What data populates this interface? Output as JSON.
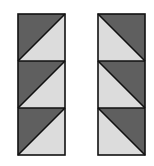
{
  "diagram": {
    "colors": {
      "dark": "#5f5f5f",
      "light": "#dcdcdc",
      "stroke": "#111111",
      "background": "#ffffff"
    },
    "columns": [
      {
        "name": "left-strip",
        "x": 17,
        "y": 13,
        "tile_size": 47,
        "tiles": [
          {
            "dark": "upper-left",
            "diagonal": "bottom-left-to-top-right"
          },
          {
            "dark": "upper-left",
            "diagonal": "bottom-left-to-top-right"
          },
          {
            "dark": "upper-left",
            "diagonal": "bottom-left-to-top-right"
          }
        ]
      },
      {
        "name": "right-strip",
        "x": 97,
        "y": 13,
        "tile_size": 47,
        "tiles": [
          {
            "dark": "upper-right",
            "diagonal": "top-left-to-bottom-right"
          },
          {
            "dark": "upper-right",
            "diagonal": "top-left-to-bottom-right"
          },
          {
            "dark": "upper-right",
            "diagonal": "top-left-to-bottom-right"
          }
        ]
      }
    ]
  }
}
